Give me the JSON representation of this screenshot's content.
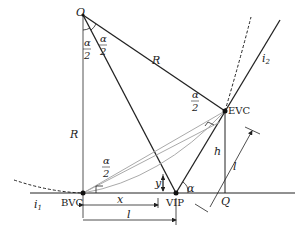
{
  "diagram": {
    "type": "vertical-curve-geometry",
    "points": {
      "O": "O",
      "BVC": "BVC",
      "VIP": "VIP",
      "EVC": "EVC",
      "Q": "Q"
    },
    "labels": {
      "R_vertical": "R",
      "R_slant": "R",
      "alpha_half_num": "α",
      "alpha_half_den": "2",
      "alpha": "α",
      "h": "h",
      "l_slant": "l",
      "x": "x",
      "l": "l",
      "y": "y",
      "i1": "i",
      "i1_sub": "1",
      "i2": "i",
      "i2_sub": "2"
    },
    "colors": {
      "line": "#222222",
      "light_line": "#aaaaaa"
    }
  }
}
